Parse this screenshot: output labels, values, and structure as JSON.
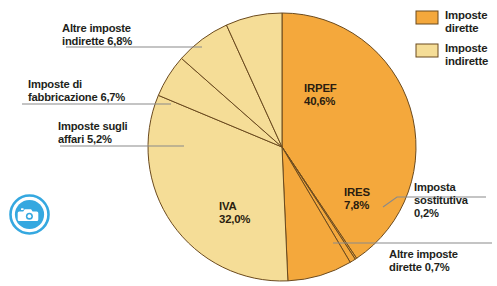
{
  "chart_data": {
    "type": "pie",
    "title": "",
    "subtitle": "",
    "xlabel": "",
    "ylabel": "",
    "grid": false,
    "legend_position": "top-right",
    "unit": "%",
    "decimal_separator": ",",
    "categories": [
      "IRPEF",
      "Imposta sostitutiva",
      "Altre imposte dirette",
      "IRES",
      "IVA",
      "Imposte sugli affari",
      "Imposte di fabbricazione",
      "Altre imposte indirette"
    ],
    "values": [
      40.6,
      0.2,
      0.7,
      7.8,
      32.0,
      5.2,
      6.7,
      6.8
    ],
    "value_labels": [
      "40,6%",
      "0,2%",
      "0,7%",
      "7,8%",
      "32,0%",
      "5,2%",
      "6,7%",
      "6,8%"
    ],
    "groups": [
      "Imposte dirette",
      "Imposte dirette",
      "Imposte dirette",
      "Imposte dirette",
      "Imposte indirette",
      "Imposte indirette",
      "Imposte indirette",
      "Imposte indirette"
    ],
    "colors": [
      "#f4a83c",
      "#f4a83c",
      "#f4a83c",
      "#f4a83c",
      "#f5dd97",
      "#f5dd97",
      "#f5dd97",
      "#f5dd97"
    ],
    "start_angle_deg": 0,
    "direction": "clockwise"
  },
  "colors": {
    "dirette": "#f4a83c",
    "indirette": "#f5dd97",
    "slice_stroke": "#6b4a1e",
    "leader_line": "#8a8a8a",
    "text": "#231f1b",
    "background": "#ffffff",
    "watermark": "#35a8e0"
  },
  "legend": {
    "items": [
      {
        "label_line1": "Imposte",
        "label_line2": "dirette",
        "swatch_color": "#f4a83c"
      },
      {
        "label_line1": "Imposte",
        "label_line2": "indirette",
        "swatch_color": "#f5dd97"
      }
    ]
  },
  "callouts": {
    "altre_indirette": {
      "line1": "Altre imposte",
      "line2": "indirette 6,8%"
    },
    "fabbricazione": {
      "line1": "Imposte di",
      "line2": "fabbricazione 6,7%"
    },
    "affari": {
      "line1": "Imposte sugli",
      "line2": "affari 5,2%"
    },
    "sostitutiva": {
      "line1": "Imposta",
      "line2": "sostitutiva",
      "line3": "0,2%"
    },
    "altre_dirette": {
      "line1": "Altre imposte",
      "line2": "dirette 0,7%"
    }
  },
  "inner_labels": {
    "irpef": {
      "line1": "IRPEF",
      "line2": "40,6%"
    },
    "iva": {
      "line1": "IVA",
      "line2": "32,0%"
    },
    "ires": {
      "line1": "IRES",
      "line2": "7,8%"
    }
  },
  "watermark": {
    "icon": "camera-icon"
  }
}
